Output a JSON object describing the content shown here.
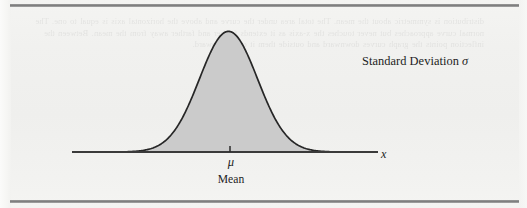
{
  "figure": {
    "kind": "bell-curve-diagram",
    "background_color": "#f1f1ef",
    "rule_color": "#8e8e8e",
    "curve_stroke_color": "#262626",
    "curve_fill_color": "#cbcbcb",
    "axis_color": "#3a3a3a",
    "text_color": "#1d1d1d"
  },
  "labels": {
    "std_dev": "Standard Deviation σ",
    "std_dev_text": "Standard Deviation",
    "std_dev_symbol": "σ",
    "x_axis": "x",
    "mu": "μ",
    "mean": "Mean"
  },
  "ghost_text": "distribution is symmetric about the mean. The total area under the curve and above the horizontal axis is equal to one. The normal curve approaches but never touches the x-axis as it extends farther and farther away from the mean. Between the inflection points the graph curves downward and outside them it curves upward.",
  "chart_data": {
    "type": "area",
    "title": "",
    "subtitle": "",
    "xlabel": "x",
    "ylabel": "",
    "grid": false,
    "legend": null,
    "annotations": [
      {
        "text": "Standard Deviation σ",
        "x": 362,
        "y": 60
      },
      {
        "text": "μ",
        "x": 231,
        "y": 162
      },
      {
        "text": "Mean",
        "x": 231,
        "y": 180
      },
      {
        "text": "x",
        "x": 385,
        "y": 153
      }
    ],
    "distribution": "normal",
    "mean": 0,
    "sigma": 1,
    "peak_pixel": {
      "x": 230,
      "y": 25
    },
    "baseline_pixel_y": 152,
    "axis_pixel_x_range": [
      72,
      378
    ],
    "curve_pixel_x_range": [
      124,
      333
    ],
    "tick_marks": [
      {
        "label": "μ",
        "pixel_x": 230
      }
    ],
    "x": [
      -3.2,
      -2.8,
      -2.4,
      -2.0,
      -1.6,
      -1.2,
      -0.8,
      -0.4,
      0.0,
      0.4,
      0.8,
      1.2,
      1.6,
      2.0,
      2.4,
      2.8,
      3.2
    ],
    "y": [
      0.0024,
      0.0079,
      0.0224,
      0.054,
      0.1109,
      0.1942,
      0.2897,
      0.3683,
      0.3989,
      0.3683,
      0.2897,
      0.1942,
      0.1109,
      0.054,
      0.0224,
      0.0079,
      0.0024
    ],
    "xlim": [
      -3.6,
      3.6
    ],
    "ylim": [
      0,
      0.42
    ],
    "fill": true
  }
}
